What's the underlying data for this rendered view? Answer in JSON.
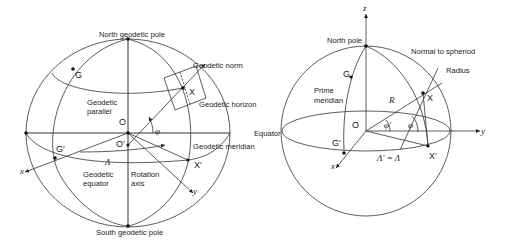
{
  "figure": {
    "left_diagram": {
      "title": "Geodetic coordinates on the spheroid",
      "labels": {
        "north_pole": "North geodetic pole",
        "south_pole": "South geodetic pole",
        "geodetic_norm": "Geodetic norm",
        "geodetic_horizon": "Geodetic horizon",
        "geodetic_parallel_1": "Geodetic",
        "geodetic_parallel_2": "parallel",
        "geodetic_meridian": "Geodetic meridian",
        "geodetic_equator_1": "Geodetic",
        "geodetic_equator_2": "equator",
        "rotation_axis_1": "Rotation",
        "rotation_axis_2": "axis",
        "point_g": "G",
        "point_g_prime": "G′",
        "point_x": "X",
        "point_x_prime": "X′",
        "origin": "O",
        "origin_prime": "O′",
        "axis_x": "x",
        "axis_y": "y",
        "longitude": "Λ",
        "latitude": "φ"
      }
    },
    "right_diagram": {
      "title": "Geocentric vs geodetic on sphere",
      "labels": {
        "north_pole": "North pole",
        "normal": "Normal to spheriod",
        "radius": "Radius",
        "prime_meridian_1": "Prime",
        "prime_meridian_2": "meridian",
        "equator": "Equator",
        "point_g": "G",
        "point_g_prime": "G′",
        "point_x": "X",
        "point_x_prime": "X′",
        "origin": "O",
        "radius_symbol": "R",
        "axis_x": "x",
        "axis_y": "y",
        "axis_z": "z",
        "latitude_geodetic": "φ",
        "latitude_geocentric": "φ′",
        "longitude_relation": "Λ′ = Λ"
      }
    },
    "colors": {
      "line": "#222222",
      "background": "#ffffff"
    }
  }
}
